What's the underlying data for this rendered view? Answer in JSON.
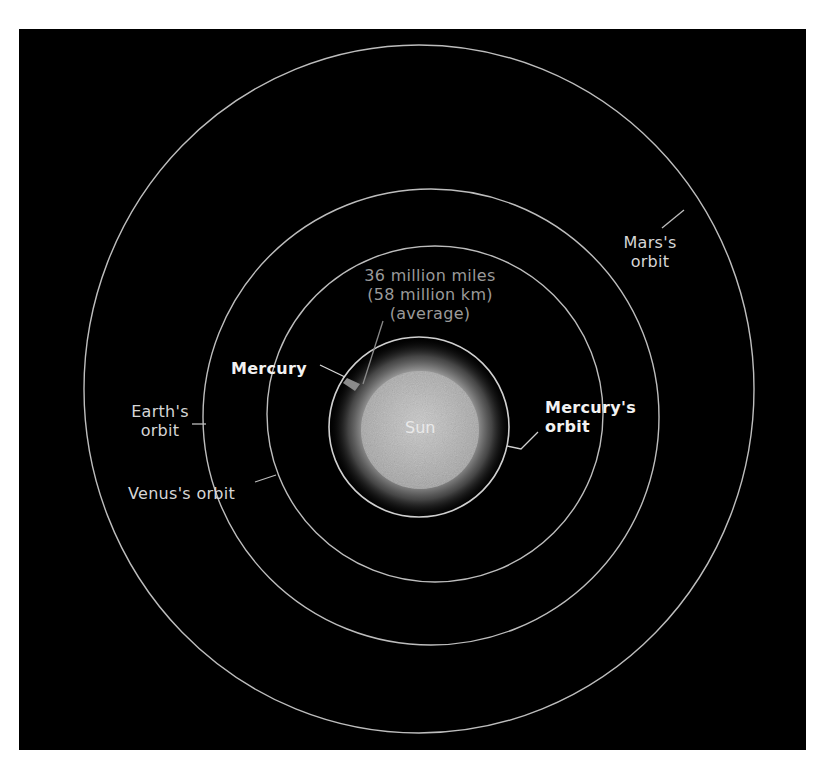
{
  "diagram": {
    "title_hidden": "Orbits of the inner planets around the Sun",
    "colors": {
      "background": "#000000",
      "orbit_line": "#bdbdbd",
      "label_text": "#d6d6d6",
      "highlight_text": "#f2f2f2",
      "distance_text": "#9a9a9a",
      "sun_core": "#b8b8b8",
      "sun_glow": "#ffffff"
    },
    "sun": {
      "label": "Sun"
    },
    "planet": {
      "label": "Mercury"
    },
    "distance_note": {
      "line1": "36 million miles",
      "line2": "(58 million km)",
      "line3": "(average)"
    },
    "orbits": [
      {
        "name": "Mercury",
        "label_line1": "Mercury's",
        "label_line2": "orbit"
      },
      {
        "name": "Venus",
        "label_line1": "Venus's orbit",
        "label_line2": ""
      },
      {
        "name": "Earth",
        "label_line1": "Earth's",
        "label_line2": "orbit"
      },
      {
        "name": "Mars",
        "label_line1": "Mars's",
        "label_line2": "orbit"
      }
    ]
  }
}
